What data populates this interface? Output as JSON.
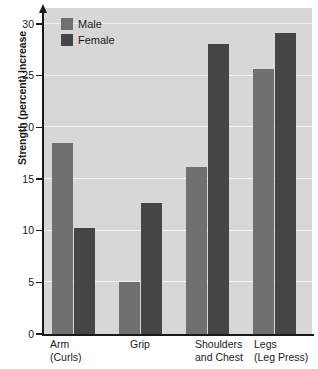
{
  "chart_data": {
    "type": "bar",
    "title": "",
    "subtitle": "",
    "xlabel": "",
    "ylabel": "Strength (percent) Increase",
    "categories": [
      "Arm\n(Curls)",
      "Grip",
      "Shoulders\nand Chest",
      "Legs\n(Leg Press)"
    ],
    "category_lines": [
      {
        "line1": "Arm",
        "line2": "(Curls)"
      },
      {
        "line1": "Grip",
        "line2": ""
      },
      {
        "line1": "Shoulders",
        "line2": "and Chest"
      },
      {
        "line1": "Legs",
        "line2": "(Leg Press)"
      }
    ],
    "series": [
      {
        "name": "Male",
        "color": "#707070",
        "values": [
          18.5,
          5.0,
          16.2,
          25.6
        ]
      },
      {
        "name": "Female",
        "color": "#454545",
        "values": [
          10.3,
          12.7,
          28.1,
          29.1
        ]
      }
    ],
    "ylim": [
      0,
      30
    ],
    "yticks": [
      0,
      5,
      10,
      15,
      20,
      25,
      30
    ],
    "ytick_labels": [
      "0",
      "5",
      "10",
      "15",
      "20",
      "25",
      "30"
    ],
    "grid": true,
    "grid_color": "#f2f2f2",
    "legend_position": "top-left",
    "plot_background": "#d7d7d7",
    "axis_color": "#1a1a1a"
  },
  "legend": {
    "items": [
      {
        "label": "Male",
        "series": "male"
      },
      {
        "label": "Female",
        "series": "female"
      }
    ]
  }
}
